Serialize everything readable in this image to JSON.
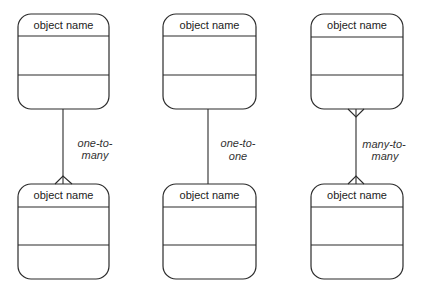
{
  "diagram": {
    "entities": [
      {
        "name": "object name"
      },
      {
        "name": "object name"
      },
      {
        "name": "object name"
      },
      {
        "name": "object name"
      },
      {
        "name": "object name"
      },
      {
        "name": "object name"
      }
    ],
    "relationships": [
      {
        "type": "one-to-many",
        "label_line1": "one-to-",
        "label_line2": "many",
        "from": 0,
        "to": 3
      },
      {
        "type": "one-to-one",
        "label_line1": "one-to-",
        "label_line2": "one",
        "from": 1,
        "to": 4
      },
      {
        "type": "many-to-many",
        "label_line1": "many-to-",
        "label_line2": "many",
        "from": 2,
        "to": 5
      }
    ],
    "colors": {
      "stroke": "#2b2b2b",
      "text": "#222222",
      "background": "#ffffff"
    }
  }
}
